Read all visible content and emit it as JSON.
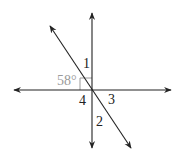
{
  "diagram": {
    "type": "intersecting-lines",
    "colors": {
      "line": "#222222",
      "given_angle": "#9a9a9a",
      "background": "#ffffff"
    },
    "lines": [
      {
        "name": "horizontal-line",
        "from": [
          14,
          90
        ],
        "to": [
          171,
          90
        ],
        "arrows": "both"
      },
      {
        "name": "vertical-line",
        "from": [
          92,
          13
        ],
        "to": [
          92,
          148
        ],
        "arrows": "both"
      },
      {
        "name": "diagonal-line",
        "from": [
          50,
          26
        ],
        "to": [
          131,
          148
        ],
        "arrows": "both"
      }
    ],
    "right_angle_marker": {
      "x": 80,
      "y": 78,
      "size": 12
    },
    "labels": {
      "angle1": "1",
      "angle2": "2",
      "angle3": "3",
      "angle4": "4",
      "given": "58°"
    }
  }
}
